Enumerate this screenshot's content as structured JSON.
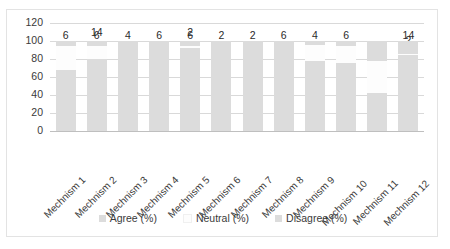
{
  "chart_data": {
    "type": "bar",
    "subtype": "stacked-column",
    "title": "",
    "xlabel": "",
    "ylabel": "",
    "ylim": [
      0,
      120
    ],
    "yticks": [
      "0",
      "20",
      "40",
      "60",
      "80",
      "100",
      "120"
    ],
    "grid": true,
    "legend_position": "bottom",
    "categories": [
      "Mechnism 1",
      "Mechnism 2",
      "Mechnism 3",
      "Mechnism 4",
      "Mechnism 5",
      "Mechnism 6",
      "Mechnism 7",
      "Mechnism 8",
      "Mechnism 9",
      "Mechnism 10",
      "Mechnism 11",
      "Mechnism 12"
    ],
    "series": [
      {
        "name": "Agree  (%)",
        "color": "#dcdcdc",
        "values": [
          68,
          80,
          96,
          94,
          92,
          98,
          98,
          94,
          78,
          76,
          42,
          84
        ]
      },
      {
        "name": "Neutral (%)",
        "color": "#fdfdfd",
        "values": [
          26,
          14,
          0,
          0,
          2,
          0,
          0,
          0,
          18,
          18,
          36,
          2
        ]
      },
      {
        "name": "Disagree (%)",
        "color": "#dcdcdc",
        "values": [
          6,
          6,
          4,
          6,
          6,
          2,
          2,
          6,
          4,
          6,
          22,
          14
        ]
      }
    ]
  },
  "colors": {
    "agree": "#dcdcdc",
    "neutral": "#fdfdfd",
    "disagree": "#dcdcdc",
    "gridline": "#d9d9d9",
    "frame": "#e3e3e3",
    "text": "#3a3a3a"
  }
}
